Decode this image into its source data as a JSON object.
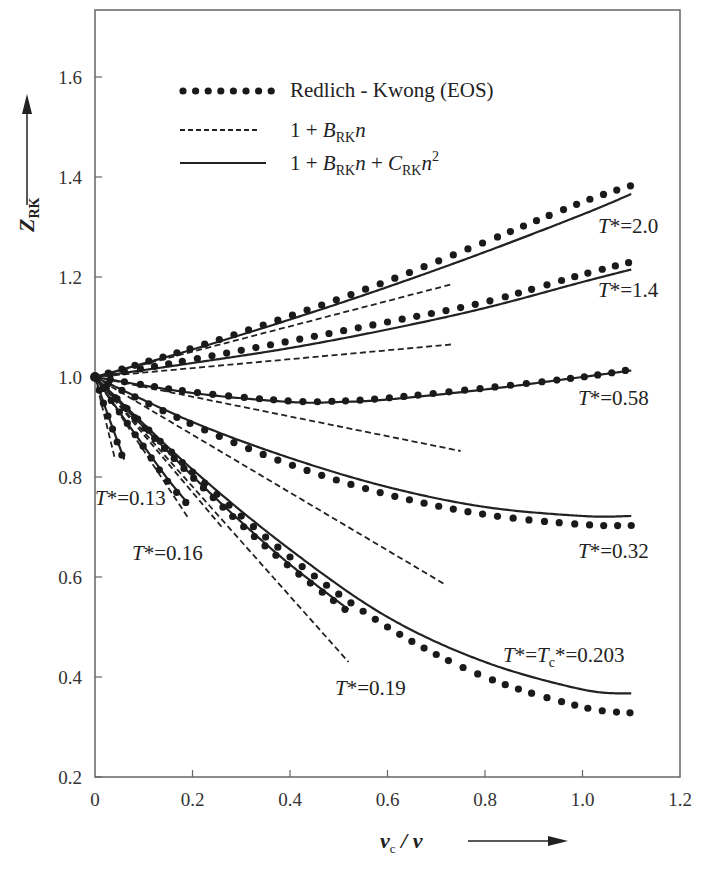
{
  "chart_data": {
    "type": "line",
    "title": "",
    "xlabel": "v_c / v",
    "ylabel": "Z_RK",
    "xlim": [
      0,
      1.2
    ],
    "ylim": [
      0.2,
      1.734
    ],
    "xticks": [
      0,
      0.2,
      0.4,
      0.6,
      0.8,
      1.0,
      1.2
    ],
    "xtick_labels": [
      "0",
      "0.2",
      "0.4",
      "0.6",
      "0.8",
      "1.0",
      "1.2"
    ],
    "yticks": [
      0.2,
      0.4,
      0.6,
      0.8,
      1.0,
      1.2,
      1.4,
      1.6
    ],
    "ytick_labels": [
      "0.2",
      "0.4",
      "0.6",
      "0.8",
      "1.0",
      "1.2",
      "1.4",
      "1.6"
    ],
    "grid": false,
    "legend_position": "upper-left",
    "legend": [
      {
        "style": "dotted",
        "label": "Redlich - Kwong (EOS)"
      },
      {
        "style": "dashed",
        "label": "1 + B_RK n"
      },
      {
        "style": "solid",
        "label": "1 + B_RK n + C_RK n^2"
      }
    ],
    "series": [
      {
        "name": "T*=2.0",
        "label": "T*=2.0",
        "rk_eos": {
          "x": [
            0,
            0.2,
            0.4,
            0.6,
            0.8,
            1.0,
            1.11
          ],
          "y": [
            1.0,
            1.058,
            1.122,
            1.192,
            1.27,
            1.35,
            1.386
          ]
        },
        "virial_B": {
          "x": [
            0,
            0.73
          ],
          "y": [
            1.0,
            1.185
          ]
        },
        "virial_BC": {
          "x": [
            0,
            0.2,
            0.4,
            0.6,
            0.8,
            1.0,
            1.1
          ],
          "y": [
            1.0,
            1.055,
            1.115,
            1.18,
            1.25,
            1.325,
            1.366
          ]
        }
      },
      {
        "name": "T*=1.4",
        "label": "T*=1.4",
        "rk_eos": {
          "x": [
            0,
            0.2,
            0.4,
            0.6,
            0.8,
            1.0,
            1.1
          ],
          "y": [
            1.0,
            1.035,
            1.072,
            1.11,
            1.15,
            1.205,
            1.23
          ]
        },
        "virial_B": {
          "x": [
            0,
            0.73
          ],
          "y": [
            1.0,
            1.065
          ]
        },
        "virial_BC": {
          "x": [
            0,
            0.2,
            0.4,
            0.6,
            0.8,
            1.0,
            1.1
          ],
          "y": [
            1.0,
            1.028,
            1.058,
            1.095,
            1.138,
            1.19,
            1.215
          ]
        }
      },
      {
        "name": "T*=0.58",
        "label": "T*=0.58",
        "rk_eos": {
          "x": [
            0,
            0.2,
            0.4,
            0.5,
            0.6,
            0.8,
            1.0,
            1.1
          ],
          "y": [
            1.0,
            0.97,
            0.952,
            0.952,
            0.958,
            0.978,
            1.0,
            1.015
          ]
        },
        "virial_B": {
          "x": [
            0,
            0.75
          ],
          "y": [
            1.0,
            0.852
          ]
        },
        "virial_BC": {
          "x": [
            0,
            0.2,
            0.4,
            0.5,
            0.6,
            0.8,
            1.0,
            1.1
          ],
          "y": [
            1.0,
            0.968,
            0.95,
            0.95,
            0.955,
            0.975,
            1.0,
            1.013
          ]
        }
      },
      {
        "name": "T*=0.32",
        "label": "T*=0.32",
        "rk_eos": {
          "x": [
            0,
            0.2,
            0.4,
            0.6,
            0.8,
            1.0,
            1.1
          ],
          "y": [
            1.0,
            0.905,
            0.825,
            0.765,
            0.725,
            0.705,
            0.703
          ]
        },
        "virial_B": {
          "x": [
            0,
            0.72
          ],
          "y": [
            1.0,
            0.584
          ]
        },
        "virial_BC": {
          "x": [
            0,
            0.2,
            0.4,
            0.6,
            0.8,
            1.0,
            1.1
          ],
          "y": [
            1.0,
            0.91,
            0.838,
            0.78,
            0.74,
            0.722,
            0.722
          ]
        }
      },
      {
        "name": "T*=Tc*=0.203",
        "label": "T*=Tc*=0.203",
        "rk_eos": {
          "x": [
            0,
            0.2,
            0.4,
            0.6,
            0.8,
            1.0,
            1.1
          ],
          "y": [
            1.0,
            0.81,
            0.64,
            0.5,
            0.4,
            0.34,
            0.328
          ]
        },
        "virial_B": {
          "x": [
            0,
            0.52
          ],
          "y": [
            1.0,
            0.43
          ]
        },
        "virial_BC": {
          "x": [
            0,
            0.2,
            0.4,
            0.6,
            0.8,
            1.0,
            1.1
          ],
          "y": [
            1.0,
            0.815,
            0.655,
            0.52,
            0.43,
            0.375,
            0.367
          ]
        }
      },
      {
        "name": "T*=0.19",
        "label": "T*=0.19",
        "rk_eos": {
          "x": [
            0,
            0.1,
            0.2,
            0.3,
            0.4,
            0.52
          ],
          "y": [
            1.0,
            0.9,
            0.8,
            0.705,
            0.62,
            0.53
          ]
        },
        "virial_B": {
          "x": [
            0,
            0.26
          ],
          "y": [
            1.0,
            0.7
          ]
        },
        "virial_BC": {
          "x": [
            0,
            0.1,
            0.2,
            0.3,
            0.4,
            0.52
          ],
          "y": [
            1.0,
            0.9,
            0.802,
            0.71,
            0.625,
            0.535
          ]
        }
      },
      {
        "name": "T*=0.16",
        "label": "T*=0.16",
        "rk_eos": {
          "x": [
            0,
            0.05,
            0.1,
            0.15,
            0.19
          ],
          "y": [
            1.0,
            0.93,
            0.86,
            0.79,
            0.745
          ]
        },
        "virial_B": {
          "x": [
            0,
            0.19
          ],
          "y": [
            1.0,
            0.72
          ]
        },
        "virial_BC": {
          "x": [
            0,
            0.05,
            0.1,
            0.15,
            0.19
          ],
          "y": [
            1.0,
            0.93,
            0.862,
            0.795,
            0.748
          ]
        }
      },
      {
        "name": "T*=0.13",
        "label": "T*=0.13",
        "rk_eos": {
          "x": [
            0,
            0.02,
            0.04,
            0.06
          ],
          "y": [
            1.0,
            0.94,
            0.885,
            0.83
          ]
        },
        "virial_B": {
          "x": [
            0,
            0.04
          ],
          "y": [
            1.0,
            0.84
          ]
        },
        "virial_BC": {
          "x": [
            0,
            0.02,
            0.04,
            0.06
          ],
          "y": [
            1.0,
            0.942,
            0.888,
            0.835
          ]
        }
      }
    ],
    "annotations": [
      {
        "text": "T*=2.0",
        "x": 1.1,
        "y": 1.3
      },
      {
        "text": "T*=1.4",
        "x": 1.1,
        "y": 1.18
      },
      {
        "text": "T*=0.58",
        "x": 1.06,
        "y": 0.96
      },
      {
        "text": "T*=0.32",
        "x": 1.06,
        "y": 0.64
      },
      {
        "text": "T*=Tc*=0.203",
        "x": 1.0,
        "y": 0.45
      },
      {
        "text": "T*=0.19",
        "x": 0.56,
        "y": 0.38
      },
      {
        "text": "T*=0.13",
        "x": 0.07,
        "y": 0.69
      },
      {
        "text": "T*=0.16",
        "x": 0.17,
        "y": 0.63
      }
    ]
  },
  "axes": {
    "y_label_main": "Z",
    "y_label_sub": "RK",
    "x_label_main": "v",
    "x_label_sub": "c",
    "x_label_rest": " / v"
  },
  "legend": {
    "item1": "Redlich - Kwong (EOS)",
    "item2_a": "1 + B",
    "item2_sub": "RK",
    "item2_b": "n",
    "item3_a": "1 + B",
    "item3_sub1": "RK",
    "item3_b": "n + C",
    "item3_sub2": "RK",
    "item3_c": "n",
    "item3_sup": "2"
  },
  "labels": {
    "t20": "=2.0",
    "t14": "=1.4",
    "t058": "=0.58",
    "t032": "=0.32",
    "tc_a": "=T",
    "tc_sub": "c",
    "tc_b": "*=0.203",
    "t019": "=0.19",
    "t013": "=0.13",
    "t016": "=0.16",
    "tstar": "T",
    "star": "*"
  }
}
